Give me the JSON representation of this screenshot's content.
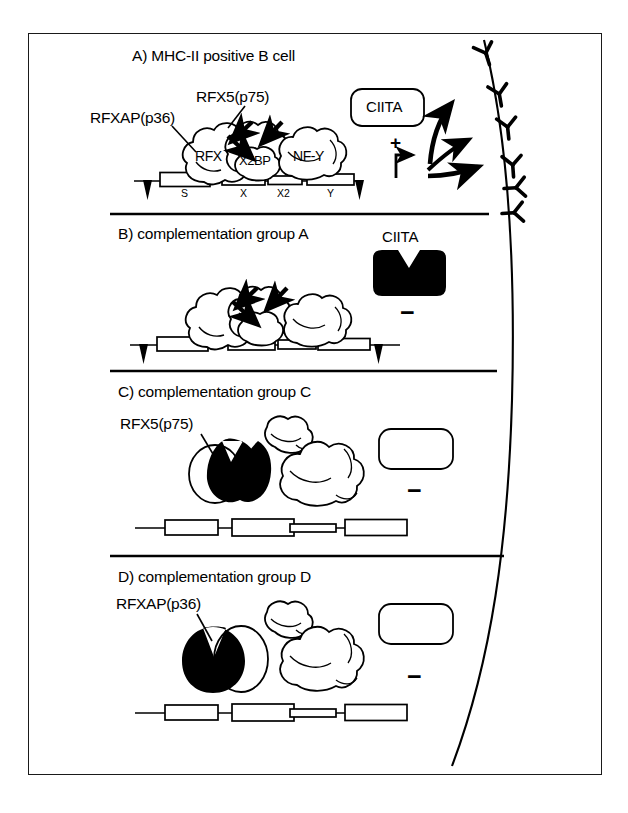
{
  "figure": {
    "title_visible": false,
    "border_color": "#1a1a1a",
    "ink_color": "#000000",
    "background": "#ffffff"
  },
  "panels": [
    {
      "id": "A",
      "title": "A) MHC-II positive B cell",
      "callouts": [
        {
          "name": "rfx5-callout",
          "text": "RFX5(p75)"
        },
        {
          "name": "rfxap-callout",
          "text": "RFXAP(p36)"
        }
      ],
      "complex_labels": [
        "RFX",
        "X2BP",
        "NF-Y"
      ],
      "ciita": {
        "label": "CIITA",
        "state": "functional",
        "filled": false,
        "label_position": "inside"
      },
      "dna_boxes": [
        "S",
        "X",
        "X2",
        "Y"
      ],
      "dna_bound": true,
      "transcription": {
        "symbol": "+",
        "arrow": "bent-arrow-right",
        "active": true
      },
      "outcome_sign": "+",
      "mhc_expressed": true
    },
    {
      "id": "B",
      "title": "B) complementation group A",
      "callouts": [],
      "complex_labels": [],
      "ciita": {
        "label": "CIITA",
        "state": "defective",
        "filled": true,
        "label_position": "above"
      },
      "dna_boxes": [
        "",
        "",
        "",
        ""
      ],
      "dna_bound": true,
      "transcription": {
        "symbol": "−",
        "arrow": "none",
        "active": false
      },
      "outcome_sign": "−",
      "mhc_expressed": false
    },
    {
      "id": "C",
      "title": "C) complementation group C",
      "callouts": [
        {
          "name": "rfx5-callout",
          "text": "RFX5(p75)"
        }
      ],
      "complex_labels": [],
      "ciita": {
        "label": "",
        "state": "present-unlabeled",
        "filled": false,
        "label_position": "none"
      },
      "dna_boxes": [
        "",
        "",
        "",
        ""
      ],
      "dna_bound": false,
      "transcription": {
        "symbol": "−",
        "arrow": "none",
        "active": false
      },
      "outcome_sign": "−",
      "mhc_expressed": false
    },
    {
      "id": "D",
      "title": "D) complementation group D",
      "callouts": [
        {
          "name": "rfxap-callout",
          "text": "RFXAP(p36)"
        }
      ],
      "complex_labels": [],
      "ciita": {
        "label": "",
        "state": "present-unlabeled",
        "filled": false,
        "label_position": "none"
      },
      "dna_boxes": [
        "",
        "",
        "",
        ""
      ],
      "dna_bound": false,
      "transcription": {
        "symbol": "−",
        "arrow": "none",
        "active": false
      },
      "outcome_sign": "−",
      "mhc_expressed": false
    }
  ],
  "membrane": {
    "name": "cell-membrane",
    "mhc_molecule_count": 6,
    "mhc_symbol": "Y-shaped-receptor"
  },
  "signs": {
    "plus": "+",
    "minus": "−"
  }
}
